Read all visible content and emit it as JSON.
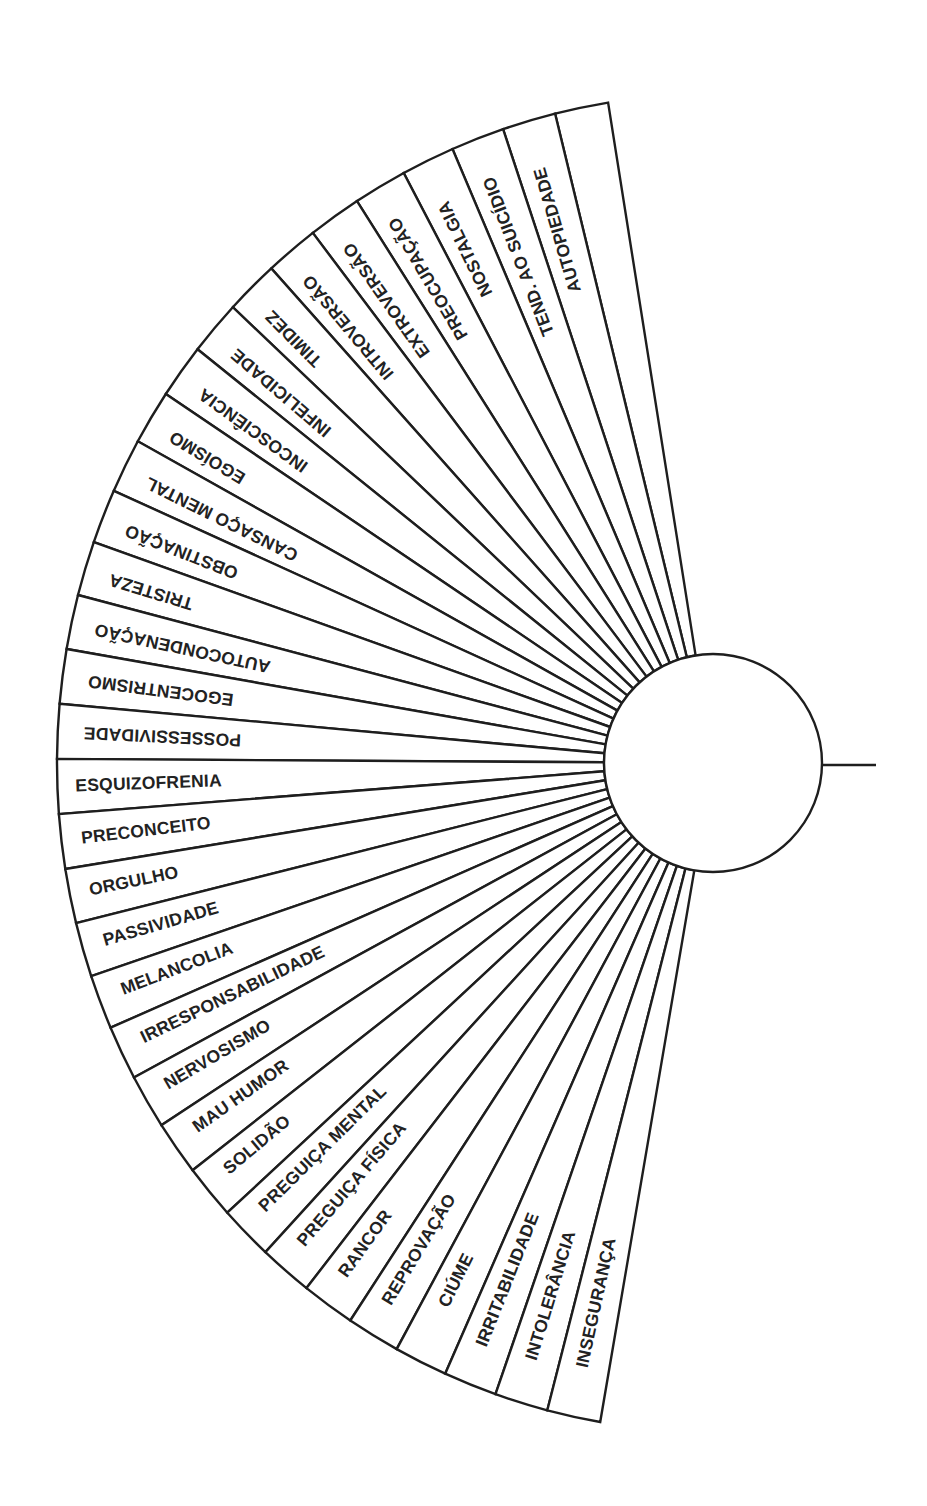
{
  "diagram": {
    "type": "radial-fan-chart",
    "colors": {
      "line": "#1e1e1e",
      "text": "#222222",
      "background": "#ffffff"
    },
    "geometry": {
      "center": [
        713,
        763
      ],
      "outer_rx": 656,
      "outer_ry": 669,
      "hub_radius": 109,
      "start_angle_deg": 260.8,
      "end_angle_deg": 99.9,
      "pointer_line": {
        "x1": 822,
        "x2": 876,
        "y": 765
      }
    },
    "sectors": [
      {
        "label": "",
        "inset": 40
      },
      {
        "label": "AUTOPIEDADE",
        "inset": 48
      },
      {
        "label": "TEND. AO SUICÍDIO",
        "inset": 40
      },
      {
        "label": "NOSTALGIA",
        "inset": 44
      },
      {
        "label": "PREOCUPAÇÃO",
        "inset": 34
      },
      {
        "label": "EXTROVERSÃO",
        "inset": 30
      },
      {
        "label": "INTROVERSÃO",
        "inset": 30
      },
      {
        "label": "TIMIDEZ",
        "inset": 30
      },
      {
        "label": "INFELICIDADE",
        "inset": 30
      },
      {
        "label": "INCOSCIÊNCIA",
        "inset": 28
      },
      {
        "label": "EGOÍSMO",
        "inset": 26
      },
      {
        "label": "CANSAÇO MENTAL",
        "inset": 26
      },
      {
        "label": "OBSTINAÇÃO",
        "inset": 26
      },
      {
        "label": "TRISTEZA",
        "inset": 26
      },
      {
        "label": "AUTOCONDENAÇÃO",
        "inset": 24
      },
      {
        "label": "EGOCENTRISMO",
        "inset": 26
      },
      {
        "label": "POSSESSIVIDADE",
        "inset": 26
      },
      {
        "label": "ESQUIZOFRENIA",
        "inset": 18
      },
      {
        "label": "PRECONCEITO",
        "inset": 20
      },
      {
        "label": "ORGULHO",
        "inset": 20
      },
      {
        "label": "PASSIVIDADE",
        "inset": 22
      },
      {
        "label": "MELANCOLIA",
        "inset": 24
      },
      {
        "label": "IRRESPONSABILIDADE",
        "inset": 24
      },
      {
        "label": "NERVOSISMO",
        "inset": 24
      },
      {
        "label": "MAU HUMOR",
        "inset": 26
      },
      {
        "label": "SOLIDÃO",
        "inset": 26
      },
      {
        "label": "PREGUIÇA MENTAL",
        "inset": 28
      },
      {
        "label": "PREGUIÇA FÍSICA",
        "inset": 30
      },
      {
        "label": "RANCOR",
        "inset": 32
      },
      {
        "label": "REPROVAÇÃO",
        "inset": 34
      },
      {
        "label": "CIÚME",
        "inset": 60
      },
      {
        "label": "IRRITABILIDADE",
        "inset": 40
      },
      {
        "label": "INTOLERÂNCIA",
        "inset": 44
      },
      {
        "label": "INSEGURANÇA",
        "inset": 50
      }
    ]
  }
}
